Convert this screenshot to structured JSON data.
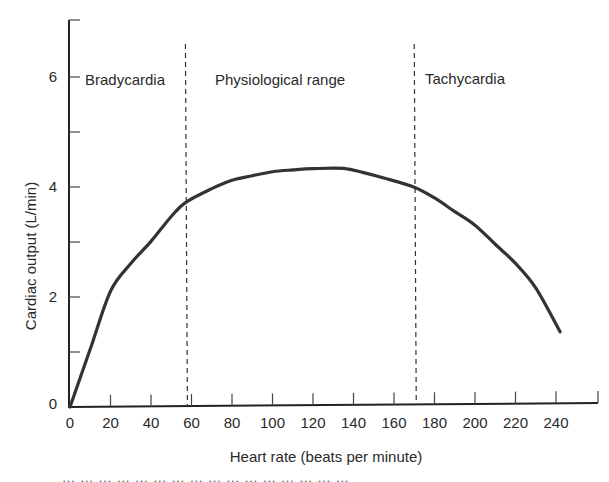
{
  "chart_data": {
    "type": "line",
    "title": "",
    "xlabel": "Heart rate (beats per minute)",
    "ylabel": "Cardiac output (L/min)",
    "xlim": [
      0,
      260
    ],
    "ylim": [
      0,
      7
    ],
    "x_ticks": [
      0,
      20,
      40,
      60,
      80,
      100,
      120,
      140,
      160,
      180,
      200,
      220,
      240
    ],
    "x_tick_labels": [
      "0",
      "20",
      "40",
      "60",
      "80",
      "100",
      "120",
      "140",
      "160",
      "180",
      "200",
      "220",
      "240"
    ],
    "y_ticks": [
      0,
      1,
      2,
      3,
      4,
      5,
      6
    ],
    "y_tick_labels": [
      "0",
      "",
      "2",
      "",
      "4",
      "",
      "6"
    ],
    "grid": false,
    "legend": null,
    "series": [
      {
        "name": "Cardiac output",
        "color": "#333333",
        "x": [
          0,
          10,
          20,
          30,
          40,
          50,
          57,
          70,
          80,
          90,
          100,
          110,
          120,
          135,
          145,
          155,
          170,
          180,
          190,
          200,
          210,
          220,
          230,
          242
        ],
        "y": [
          0,
          1.05,
          2.1,
          2.6,
          3.0,
          3.45,
          3.7,
          3.95,
          4.1,
          4.18,
          4.25,
          4.28,
          4.3,
          4.3,
          4.22,
          4.12,
          3.95,
          3.75,
          3.5,
          3.25,
          2.9,
          2.55,
          2.1,
          1.3
        ]
      }
    ],
    "annotations": [
      {
        "type": "vline",
        "x": 57,
        "style": "dashed"
      },
      {
        "type": "vline",
        "x": 170,
        "style": "dashed"
      },
      {
        "type": "text",
        "text": "Bradycardia",
        "x": 5,
        "y": 6
      },
      {
        "type": "text",
        "text": "Physiological range",
        "x": 80,
        "y": 6
      },
      {
        "type": "text",
        "text": "Tachycardia",
        "x": 175,
        "y": 6
      }
    ]
  },
  "regions": {
    "bradycardia": "Bradycardia",
    "physiological": "Physiological range",
    "tachycardia": "Tachycardia"
  },
  "axes": {
    "x_title": "Heart rate (beats per minute)",
    "y_title": "Cardiac output (L/min)"
  },
  "caption_fragment": "… … … … … … … … … … … … … … … …"
}
